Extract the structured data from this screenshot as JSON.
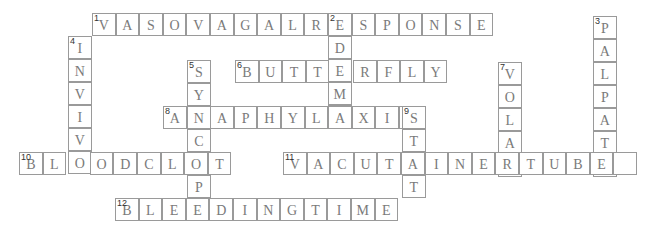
{
  "puzzle": {
    "cell_w": 23.6,
    "cell_h": 23,
    "origin_x": 19,
    "words": [
      {
        "number": "1",
        "direction": "across",
        "answer": "VASOVAGALRESPONSE",
        "x": 92,
        "y": 13
      },
      {
        "number": "2",
        "direction": "down",
        "answer": "EDEMA",
        "x": 328,
        "y": 13
      },
      {
        "number": "3",
        "direction": "down",
        "answer": "PALPATE",
        "x": 593,
        "y": 16
      },
      {
        "number": "4",
        "direction": "down",
        "answer": "INVIVO",
        "x": 68,
        "y": 36
      },
      {
        "number": "5",
        "direction": "down",
        "answer": "SYNCOPE",
        "x": 187,
        "y": 60
      },
      {
        "number": "6",
        "direction": "across",
        "answer": "BUTTERFLY",
        "x": 235,
        "y": 60
      },
      {
        "number": "7",
        "direction": "down",
        "answer": "VOLAR",
        "x": 498,
        "y": 62
      },
      {
        "number": "8",
        "direction": "across",
        "answer": "ANAPHYLAXIS",
        "x": 163,
        "y": 106
      },
      {
        "number": "9",
        "direction": "down",
        "answer": "STAT",
        "x": 402,
        "y": 106
      },
      {
        "number": "10",
        "direction": "across",
        "answer": "BLOODCLOT",
        "x": 19,
        "y": 152
      },
      {
        "number": "11",
        "direction": "across",
        "answer": "VACUTAINERTUBE ",
        "x": 283,
        "y": 152
      },
      {
        "number": "12",
        "direction": "across",
        "answer": "BLEEDINGTIME",
        "x": 115,
        "y": 198
      }
    ]
  }
}
